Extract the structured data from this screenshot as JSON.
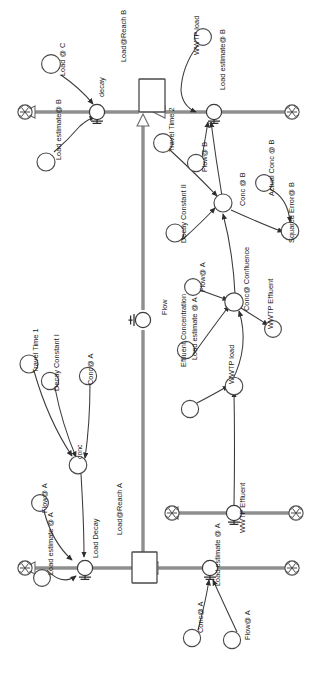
{
  "diagram": {
    "type": "system-dynamics-stock-flow",
    "orientation": "rotated-90-counterclockwise",
    "page": {
      "width": 319,
      "height": 682,
      "background": "#ffffff"
    },
    "style": {
      "stroke": "#3d3d3d",
      "connector_stroke": "#4a4a4a",
      "flow_pipe": "#8a8a8a",
      "converter_fill": "#ffffff",
      "stock_fill": "#ffffff"
    },
    "stocks": [
      {
        "id": "reach_b",
        "label": "Load@Reach B"
      },
      {
        "id": "reach_a",
        "label": "Load@Reach A"
      }
    ],
    "flows": [
      {
        "id": "decay_b",
        "label": "decay",
        "valve": true
      },
      {
        "id": "load_est_b",
        "label": "Load estimate@ B",
        "valve": true
      },
      {
        "id": "flow_mid",
        "label": "Flow",
        "valve": true
      },
      {
        "id": "wwtp_eff_v",
        "label": "WWTP Effluent",
        "valve": true
      },
      {
        "id": "load_decay",
        "label": "Load Decay",
        "valve": true
      },
      {
        "id": "load_est_a",
        "label": "Load estimate @ A",
        "valve": true
      }
    ],
    "converters": [
      {
        "id": "load_at_c",
        "label": "Load @ C"
      },
      {
        "id": "load_est_b_conv",
        "label": "Load estimate@ B"
      },
      {
        "id": "wwtp_load_b",
        "label": "WWTP load"
      },
      {
        "id": "travel_time_2",
        "label": "Travel Time 2"
      },
      {
        "id": "flow_at_b",
        "label": "Flow@ B"
      },
      {
        "id": "conc_at_b",
        "label": "Conc @ B"
      },
      {
        "id": "actual_conc_at_b",
        "label": "Actual Conc @ B"
      },
      {
        "id": "squared_error_b",
        "label": "Squared Error@ B"
      },
      {
        "id": "decay_constant_ii",
        "label": "Decay Constant II"
      },
      {
        "id": "flow_at_a_mid",
        "label": "Flow@ A"
      },
      {
        "id": "conc_confluence",
        "label": "Conc@ Confluence"
      },
      {
        "id": "load_est_at_a_mid",
        "label": "Load estimate @ A"
      },
      {
        "id": "wwtp_load_mid",
        "label": "WWTP load"
      },
      {
        "id": "wwtp_effluent_c",
        "label": "WWTP Effluent"
      },
      {
        "id": "effluent_conc",
        "label": "Effluent Concentration"
      },
      {
        "id": "travel_time_1",
        "label": "Travel Time 1"
      },
      {
        "id": "decay_constant_i",
        "label": "Decay Constant I"
      },
      {
        "id": "conc_at_a_top",
        "label": "Conc@ A"
      },
      {
        "id": "conc_node",
        "label": "conc"
      },
      {
        "id": "flow_at_a_left",
        "label": "Flow@ A"
      },
      {
        "id": "load_est_at_a_l",
        "label": "Load estimate @ A"
      },
      {
        "id": "conc_at_a_btm",
        "label": "Conc@ A"
      },
      {
        "id": "flow_at_a_btm",
        "label": "Flow@ A"
      }
    ],
    "clouds": [
      {
        "id": "cloud_decay_b_sink"
      },
      {
        "id": "cloud_load_est_b_src"
      },
      {
        "id": "cloud_wwtp_eff_left"
      },
      {
        "id": "cloud_wwtp_eff_right"
      },
      {
        "id": "cloud_load_decay_sink"
      },
      {
        "id": "cloud_load_est_a_src"
      }
    ],
    "labels": [
      {
        "id": "l_load_at_c",
        "text": "Load @ C",
        "x": 65,
        "y": 76,
        "rot": -90
      },
      {
        "id": "l_load_est_b_conv",
        "text": "Load estimate@ B",
        "x": 61,
        "y": 160,
        "rot": -90
      },
      {
        "id": "l_decay",
        "text": "decay",
        "x": 104,
        "y": 97,
        "rot": -90
      },
      {
        "id": "l_reach_b",
        "text": "Load@Reach B",
        "x": 126,
        "y": 62,
        "rot": -90
      },
      {
        "id": "l_wwtp_load_b",
        "text": "WWTP load",
        "x": 199,
        "y": 55,
        "rot": -90
      },
      {
        "id": "l_load_est_b",
        "text": "Load estimate@ B",
        "x": 225,
        "y": 90,
        "rot": -90
      },
      {
        "id": "l_travel_time_2",
        "text": "Travel Time 2",
        "x": 174,
        "y": 152,
        "rot": -90
      },
      {
        "id": "l_flow_at_b",
        "text": "Flow@ B",
        "x": 207,
        "y": 172,
        "rot": -90
      },
      {
        "id": "l_conc_at_b",
        "text": "Conc @ B",
        "x": 245,
        "y": 206,
        "rot": -90
      },
      {
        "id": "l_actual_conc_b",
        "text": "Actual Conc @ B",
        "x": 274,
        "y": 196,
        "rot": -90
      },
      {
        "id": "l_squared_error_b",
        "text": "Squared Error@ B",
        "x": 294,
        "y": 243,
        "rot": -90
      },
      {
        "id": "l_decay_const_ii",
        "text": "Decay Constant II",
        "x": 186,
        "y": 243,
        "rot": -90
      },
      {
        "id": "l_flow_at_a_mid",
        "text": "Flow@ A",
        "x": 205,
        "y": 292,
        "rot": -90
      },
      {
        "id": "l_flow_valve",
        "text": "Flow",
        "x": 167,
        "y": 315,
        "rot": -90
      },
      {
        "id": "l_conc_confluence",
        "text": "Conc@ Confluence",
        "x": 249,
        "y": 311,
        "rot": -90
      },
      {
        "id": "l_wwtp_effluent_c",
        "text": "WWTP Effluent",
        "x": 273,
        "y": 329,
        "rot": -90
      },
      {
        "id": "l_eff_conc",
        "text": "Effluent Concentration",
        "x": 186,
        "y": 367,
        "rot": -90
      },
      {
        "id": "l_load_est_a_mid",
        "text": "Load estimate @ A",
        "x": 197,
        "y": 360,
        "rot": -90
      },
      {
        "id": "l_wwtp_load_mid",
        "text": "WWTP load",
        "x": 234,
        "y": 384,
        "rot": -90
      },
      {
        "id": "l_travel_time_1",
        "text": "Travel Time 1",
        "x": 38,
        "y": 373,
        "rot": -90
      },
      {
        "id": "l_decay_const_i",
        "text": "Decay Constant I",
        "x": 59,
        "y": 391,
        "rot": -90
      },
      {
        "id": "l_conc_at_a_top",
        "text": "Conc@ A",
        "x": 93,
        "y": 385,
        "rot": -90
      },
      {
        "id": "l_conc_node",
        "text": "conc",
        "x": 82,
        "y": 459,
        "rot": -90
      },
      {
        "id": "l_flow_at_a_left",
        "text": "Flow@ A",
        "x": 47,
        "y": 513,
        "rot": -90
      },
      {
        "id": "l_load_est_a_left",
        "text": "Load estimate @ A",
        "x": 53,
        "y": 575,
        "rot": -90
      },
      {
        "id": "l_load_decay",
        "text": "Load Decay",
        "x": 98,
        "y": 558,
        "rot": -90
      },
      {
        "id": "l_reach_a",
        "text": "Load@Reach A",
        "x": 122,
        "y": 535,
        "rot": -90
      },
      {
        "id": "l_wwtp_eff_valve",
        "text": "WWTP Effluent",
        "x": 245,
        "y": 533,
        "rot": -90
      },
      {
        "id": "l_load_est_a_btm",
        "text": "Load estimate @ A",
        "x": 220,
        "y": 586,
        "rot": -90
      },
      {
        "id": "l_conc_at_a_btm",
        "text": "Conc@ A",
        "x": 203,
        "y": 633,
        "rot": -90
      },
      {
        "id": "l_flow_at_a_btm",
        "text": "Flow@ A",
        "x": 250,
        "y": 640,
        "rot": -90
      }
    ]
  }
}
